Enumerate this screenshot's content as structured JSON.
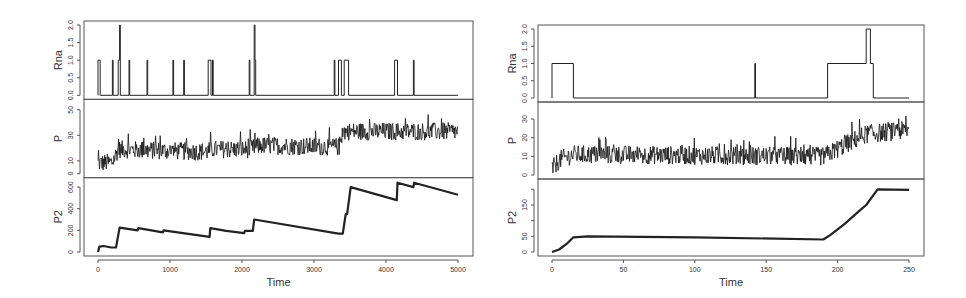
{
  "chart_data": [
    {
      "id": "left",
      "type": "line",
      "title": "",
      "xlabel": "Time",
      "xlim": [
        0,
        5000
      ],
      "x_ticks": [
        0,
        1000,
        2000,
        3000,
        4000,
        5000
      ],
      "box": {
        "x0": 84,
        "x1": 473,
        "y0": 21,
        "y1": 256,
        "xpix0": 98,
        "xpix1": 458
      },
      "panels": [
        {
          "ylabel": "Rna",
          "ylim": [
            0,
            2.0
          ],
          "y_ticks": [
            0.0,
            0.5,
            1.0,
            1.5,
            2.0
          ],
          "y_tick_labels": [
            "0.0",
            "0.5",
            "1.0",
            "1.5",
            "2.0"
          ],
          "style": "step",
          "segments": [
            [
              0,
              0
            ],
            [
              0,
              1
            ],
            [
              30,
              1
            ],
            [
              30,
              0
            ],
            [
              200,
              0
            ],
            [
              200,
              1
            ],
            [
              210,
              1
            ],
            [
              210,
              0
            ],
            [
              280,
              0
            ],
            [
              280,
              1
            ],
            [
              300,
              1
            ],
            [
              300,
              2
            ],
            [
              310,
              2
            ],
            [
              310,
              0
            ],
            [
              430,
              0
            ],
            [
              430,
              1
            ],
            [
              440,
              1
            ],
            [
              440,
              0
            ],
            [
              680,
              0
            ],
            [
              680,
              1
            ],
            [
              690,
              1
            ],
            [
              690,
              0
            ],
            [
              1040,
              0
            ],
            [
              1040,
              1
            ],
            [
              1050,
              1
            ],
            [
              1050,
              0
            ],
            [
              1190,
              0
            ],
            [
              1190,
              1
            ],
            [
              1200,
              1
            ],
            [
              1200,
              0
            ],
            [
              1530,
              0
            ],
            [
              1530,
              1
            ],
            [
              1570,
              1
            ],
            [
              1570,
              0
            ],
            [
              1590,
              0
            ],
            [
              1590,
              1
            ],
            [
              1600,
              1
            ],
            [
              1600,
              0
            ],
            [
              2100,
              0
            ],
            [
              2100,
              1
            ],
            [
              2110,
              1
            ],
            [
              2110,
              0
            ],
            [
              2170,
              0
            ],
            [
              2170,
              2
            ],
            [
              2180,
              2
            ],
            [
              2180,
              1
            ],
            [
              2190,
              1
            ],
            [
              2190,
              0
            ],
            [
              3280,
              0
            ],
            [
              3280,
              1
            ],
            [
              3290,
              1
            ],
            [
              3290,
              0
            ],
            [
              3340,
              0
            ],
            [
              3340,
              1
            ],
            [
              3380,
              1
            ],
            [
              3380,
              0
            ],
            [
              3420,
              0
            ],
            [
              3420,
              1
            ],
            [
              3480,
              1
            ],
            [
              3480,
              0
            ],
            [
              4120,
              0
            ],
            [
              4120,
              1
            ],
            [
              4160,
              1
            ],
            [
              4160,
              0
            ],
            [
              4380,
              0
            ],
            [
              4380,
              1
            ],
            [
              4390,
              1
            ],
            [
              4390,
              0
            ],
            [
              5000,
              0
            ]
          ]
        },
        {
          "ylabel": "P",
          "ylim": [
            0,
            55
          ],
          "y_ticks": [
            0,
            10,
            30,
            50
          ],
          "y_tick_labels": [
            "0",
            "10",
            "30",
            "50"
          ],
          "style": "noisy",
          "trend": [
            [
              0,
              8
            ],
            [
              200,
              9
            ],
            [
              280,
              19
            ],
            [
              1500,
              17
            ],
            [
              1600,
              19
            ],
            [
              2100,
              19
            ],
            [
              2250,
              22
            ],
            [
              3350,
              21
            ],
            [
              3400,
              33
            ],
            [
              5000,
              33
            ]
          ],
          "noise": 7
        },
        {
          "ylabel": "P2",
          "ylim": [
            0,
            650
          ],
          "y_ticks": [
            0,
            200,
            400,
            600
          ],
          "y_tick_labels": [
            "0",
            "200",
            "400",
            "600"
          ],
          "style": "line",
          "points": [
            [
              0,
              0
            ],
            [
              20,
              50
            ],
            [
              80,
              55
            ],
            [
              180,
              42
            ],
            [
              250,
              42
            ],
            [
              300,
              225
            ],
            [
              550,
              200
            ],
            [
              560,
              220
            ],
            [
              900,
              182
            ],
            [
              910,
              200
            ],
            [
              1550,
              140
            ],
            [
              1560,
              220
            ],
            [
              1780,
              195
            ],
            [
              2030,
              175
            ],
            [
              2040,
              195
            ],
            [
              2150,
              195
            ],
            [
              2170,
              300
            ],
            [
              3340,
              170
            ],
            [
              3400,
              170
            ],
            [
              3440,
              350
            ],
            [
              3460,
              350
            ],
            [
              3510,
              600
            ],
            [
              4150,
              480
            ],
            [
              4160,
              640
            ],
            [
              4380,
              600
            ],
            [
              4390,
              640
            ],
            [
              5000,
              530
            ]
          ]
        }
      ]
    },
    {
      "id": "right",
      "type": "line",
      "title": "",
      "xlabel": "Time",
      "xlim": [
        0,
        250
      ],
      "x_ticks": [
        0,
        50,
        100,
        150,
        200,
        250
      ],
      "box": {
        "x0": 538,
        "x1": 924,
        "y0": 25,
        "y1": 256,
        "xpix0": 552,
        "xpix1": 909
      },
      "panels": [
        {
          "ylabel": "Rna",
          "ylim": [
            0,
            2.0
          ],
          "y_ticks": [
            0.0,
            0.5,
            1.0,
            1.5,
            2.0
          ],
          "y_tick_labels": [
            "0.0",
            "0.5",
            "1.0",
            "1.5",
            "2.0"
          ],
          "style": "step",
          "segments": [
            [
              0,
              0
            ],
            [
              0,
              1
            ],
            [
              15,
              1
            ],
            [
              15,
              0
            ],
            [
              142,
              0
            ],
            [
              142,
              1
            ],
            [
              142.5,
              1
            ],
            [
              142.5,
              0
            ],
            [
              193,
              0
            ],
            [
              193,
              1
            ],
            [
              220,
              1
            ],
            [
              220,
              2
            ],
            [
              223,
              2
            ],
            [
              223,
              1
            ],
            [
              225,
              1
            ],
            [
              225,
              0
            ],
            [
              250,
              0
            ]
          ]
        },
        {
          "ylabel": "P",
          "ylim": [
            0,
            37
          ],
          "y_ticks": [
            0,
            10,
            20,
            30
          ],
          "y_tick_labels": [
            "0",
            "10",
            "20",
            "30"
          ],
          "style": "noisy",
          "trend": [
            [
              0,
              3
            ],
            [
              5,
              8
            ],
            [
              15,
              11
            ],
            [
              190,
              10
            ],
            [
              200,
              14
            ],
            [
              220,
              22
            ],
            [
              250,
              24
            ]
          ],
          "noise": 5
        },
        {
          "ylabel": "P2",
          "ylim": [
            0,
            220
          ],
          "y_ticks": [
            0,
            50,
            100,
            150,
            200
          ],
          "y_tick_labels": [
            "0",
            "50",
            "",
            "150",
            ""
          ],
          "style": "line",
          "points": [
            [
              0,
              0
            ],
            [
              5,
              8
            ],
            [
              10,
              25
            ],
            [
              15,
              47
            ],
            [
              25,
              50
            ],
            [
              100,
              47
            ],
            [
              190,
              40
            ],
            [
              195,
              55
            ],
            [
              205,
              90
            ],
            [
              215,
              130
            ],
            [
              220,
              150
            ],
            [
              228,
              200
            ],
            [
              250,
              198
            ]
          ]
        }
      ]
    }
  ]
}
